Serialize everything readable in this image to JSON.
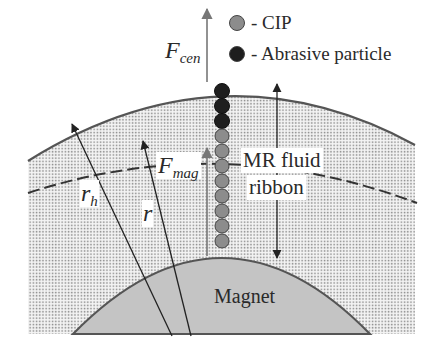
{
  "legend": {
    "items": [
      {
        "symbol": "gray-circle",
        "label": "- CIP",
        "color": "#8c8c8c"
      },
      {
        "symbol": "black-circle",
        "label": "- Abrasive particle",
        "color": "#1e1e1e"
      }
    ]
  },
  "labels": {
    "f_cen_main": "F",
    "f_cen_sub": "cen",
    "f_mag_main": "F",
    "f_mag_sub": "mag",
    "r_h_main": "r",
    "r_h_sub": "h",
    "r": "r",
    "ribbon_line1": "MR fluid",
    "ribbon_line2": "ribbon",
    "magnet": "Magnet"
  },
  "colors": {
    "magnet_fill": "#c4c4c4",
    "fluid_dots": "#8a8a8a",
    "cip": "#8c8c8c",
    "abrasive": "#1e1e1e",
    "lines": "#333333",
    "arc": "#555555"
  },
  "particles": {
    "abrasive_count": 3,
    "cip_count": 8
  }
}
